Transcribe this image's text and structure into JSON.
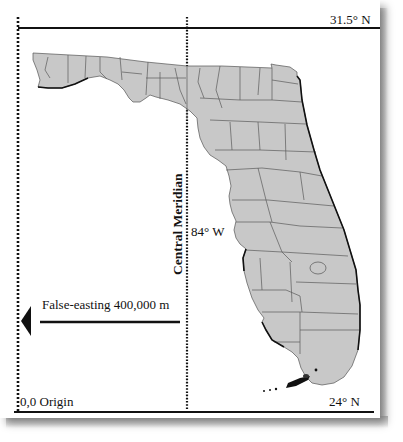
{
  "figure": {
    "title_fragment": "...",
    "top_parallel_label": "31.5° N",
    "bottom_parallel_label": "24° N",
    "central_meridian_label": "Central Meridian",
    "meridian_value_label": "84° W",
    "false_easting_label": "False-easting 400,000 m",
    "origin_label": "0,0 Origin",
    "colors": {
      "land_fill": "#c8c8c8",
      "county_lines": "#555555",
      "coast": "#111111",
      "frame_lines": "#111111"
    },
    "region_depicted": "Florida (counties)"
  }
}
